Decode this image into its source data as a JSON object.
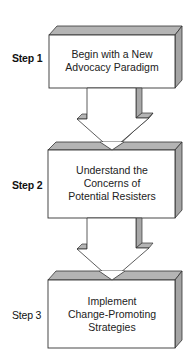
{
  "diagram": {
    "colors": {
      "face": "#ffffff",
      "shade": "#b4b4b4",
      "shade_dark": "#9a9a9a",
      "stroke": "#333333"
    },
    "steps": [
      {
        "label": "Step 1",
        "lines": [
          "Begin with a New",
          "Advocacy Paradigm"
        ]
      },
      {
        "label": "Step 2",
        "lines": [
          "Understand the",
          "Concerns of",
          "Potential Resisters"
        ]
      },
      {
        "label": "Step 3",
        "lines": [
          "Implement",
          "Change-Promoting",
          "Strategies"
        ]
      }
    ],
    "arrows": [
      {
        "from": "Step 1",
        "to": "Step 2",
        "direction": "down"
      },
      {
        "from": "Step 2",
        "to": "Step 3",
        "direction": "down"
      }
    ]
  }
}
